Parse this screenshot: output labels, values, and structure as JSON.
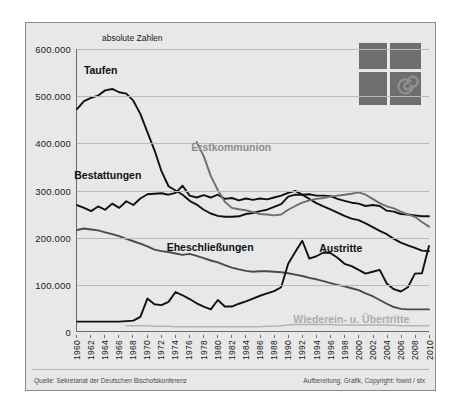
{
  "figure": {
    "axis_note": "absolute Zahlen",
    "logo_name": "fowid-logo",
    "footer_left": "Quelle: Sekretariat der Deutschen Bischofskonferenz",
    "footer_right": "Aufbereitung, Grafik, Copyright: fowid / stx"
  },
  "colors": {
    "background": "#e8e8e8",
    "dark_series": "#111111",
    "mid_series": "#6e6e6e",
    "light_series": "#b3b3b3",
    "grid": "#b9b9b9",
    "axis": "#6b6b6b"
  },
  "chart_data": {
    "type": "line",
    "title": "",
    "subtitle": "absolute Zahlen",
    "xlabel": "",
    "ylabel": "absolute Zahlen",
    "xlim": [
      1960,
      2010
    ],
    "ylim": [
      0,
      600000
    ],
    "grid": true,
    "legend_position": "inline-labels",
    "ytick_labels": [
      "600.000",
      "500.000",
      "400.000",
      "300.000",
      "200.000",
      "100.000",
      "0"
    ],
    "ytick_values": [
      600000,
      500000,
      400000,
      300000,
      200000,
      100000,
      0
    ],
    "xtick_labels": [
      "1960",
      "1962",
      "1964",
      "1966",
      "1968",
      "1970",
      "1972",
      "1974",
      "1976",
      "1978",
      "1980",
      "1982",
      "1984",
      "1986",
      "1988",
      "1990",
      "1992",
      "1994",
      "1996",
      "1998",
      "2000",
      "2002",
      "2004",
      "2006",
      "2008",
      "2010"
    ],
    "x": [
      1960,
      1961,
      1962,
      1963,
      1964,
      1965,
      1966,
      1967,
      1968,
      1969,
      1970,
      1971,
      1972,
      1973,
      1974,
      1975,
      1976,
      1977,
      1978,
      1979,
      1980,
      1981,
      1982,
      1983,
      1984,
      1985,
      1986,
      1987,
      1988,
      1989,
      1990,
      1991,
      1992,
      1993,
      1994,
      1995,
      1996,
      1997,
      1998,
      1999,
      2000,
      2001,
      2002,
      2003,
      2004,
      2005,
      2006,
      2007,
      2008,
      2009,
      2010
    ],
    "series": [
      {
        "name": "Taufen",
        "color": "#111111",
        "label_position": {
          "x": 1963.5,
          "y": 556000
        },
        "values": [
          472000,
          489000,
          496000,
          501000,
          512000,
          515000,
          508000,
          505000,
          490000,
          462000,
          423000,
          385000,
          340000,
          308000,
          299000,
          290000,
          277000,
          269000,
          258000,
          250000,
          245000,
          243000,
          243000,
          244000,
          249000,
          251000,
          255000,
          258000,
          264000,
          270000,
          286000,
          290000,
          290000,
          281000,
          272000,
          265000,
          259000,
          252000,
          245000,
          239000,
          236000,
          229000,
          221000,
          213000,
          206000,
          196000,
          188000,
          182000,
          177000,
          171000,
          170000
        ]
      },
      {
        "name": "Bestattungen",
        "color": "#111111",
        "label_position": {
          "x": 1964.5,
          "y": 332000
        },
        "values": [
          268000,
          262000,
          255000,
          265000,
          258000,
          271000,
          262000,
          276000,
          268000,
          282000,
          291000,
          292000,
          293000,
          290000,
          294000,
          309000,
          288000,
          284000,
          289000,
          284000,
          290000,
          281000,
          283000,
          278000,
          282000,
          279000,
          282000,
          280000,
          284000,
          288000,
          294000,
          298000,
          290000,
          291000,
          288000,
          288000,
          287000,
          281000,
          277000,
          273000,
          271000,
          266000,
          268000,
          266000,
          256000,
          254000,
          249000,
          248000,
          246000,
          244000,
          244000
        ]
      },
      {
        "name": "Erstkommunion",
        "color": "#6e6e6e",
        "label_position": {
          "x": 1982,
          "y": 392000
        },
        "values": [
          null,
          null,
          null,
          null,
          null,
          null,
          null,
          null,
          null,
          null,
          null,
          null,
          null,
          null,
          null,
          null,
          null,
          402000,
          372000,
          330000,
          300000,
          275000,
          262000,
          259000,
          257000,
          253000,
          249000,
          248000,
          246000,
          248000,
          258000,
          266000,
          273000,
          278000,
          281000,
          283000,
          286000,
          288000,
          290000,
          292000,
          295000,
          290000,
          281000,
          272000,
          265000,
          261000,
          254000,
          248000,
          243000,
          232000,
          222000
        ]
      },
      {
        "name": "Eheschließungen",
        "color": "#4a4a4a",
        "label_position": {
          "x": 1979,
          "y": 181000
        },
        "values": [
          215000,
          218000,
          216000,
          214000,
          210000,
          206000,
          202000,
          196000,
          191000,
          186000,
          180000,
          173000,
          170000,
          168000,
          165000,
          162000,
          164000,
          160000,
          155000,
          150000,
          146000,
          140000,
          135000,
          131000,
          128000,
          126000,
          127000,
          127000,
          126000,
          125000,
          123000,
          120000,
          117000,
          113000,
          110000,
          106000,
          102000,
          98000,
          95000,
          91000,
          87000,
          80000,
          74000,
          66000,
          58000,
          51000,
          47000,
          46000,
          46000,
          46000,
          46000
        ]
      },
      {
        "name": "Austritte",
        "color": "#111111",
        "label_position": {
          "x": 1997.5,
          "y": 178000
        },
        "values": [
          20000,
          20000,
          20000,
          20000,
          20000,
          20000,
          20000,
          21000,
          22000,
          30000,
          69000,
          57000,
          55000,
          62000,
          83000,
          76000,
          68000,
          59000,
          52000,
          46000,
          66000,
          52000,
          52000,
          58000,
          63000,
          69000,
          75000,
          80000,
          85000,
          93000,
          143000,
          168000,
          192000,
          154000,
          159000,
          167000,
          166000,
          156000,
          143000,
          138000,
          130000,
          122000,
          126000,
          130000,
          101000,
          89000,
          84000,
          93000,
          122000,
          123000,
          181000
        ]
      },
      {
        "name": "Wiederein- u. Übertritte",
        "color": "#b3b3b3",
        "label_position": {
          "x": 1999,
          "y": 27000
        },
        "values": [
          null,
          null,
          null,
          null,
          null,
          null,
          null,
          11000,
          11000,
          11000,
          11000,
          10000,
          10000,
          10000,
          9000,
          9000,
          9000,
          9000,
          9000,
          9000,
          9000,
          9000,
          9000,
          9000,
          9000,
          9000,
          9000,
          10000,
          10000,
          11000,
          13000,
          14000,
          14000,
          14000,
          14000,
          14000,
          14000,
          13000,
          13000,
          13000,
          13000,
          13000,
          13000,
          13000,
          13000,
          12000,
          11000,
          11000,
          11000,
          11000,
          11000
        ]
      }
    ]
  }
}
